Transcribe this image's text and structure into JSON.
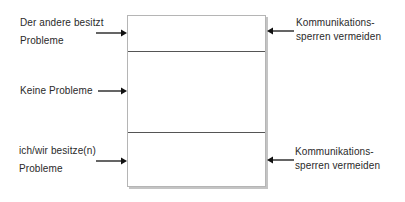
{
  "diagram": {
    "left_labels": [
      {
        "line1": "Der andere besitzt",
        "line2": "Probleme"
      },
      {
        "line1": "Keine Probleme",
        "line2": ""
      },
      {
        "line1": "ich/wir besitze(n)",
        "line2": "Probleme"
      }
    ],
    "right_labels": [
      {
        "line1": "Kommunikations-",
        "line2": "sperren vermeiden"
      },
      {
        "line1": "Kommunikations-",
        "line2": "sperren vermeiden"
      }
    ],
    "box": {
      "sections": [
        "top",
        "middle",
        "bottom"
      ]
    },
    "colors": {
      "text": "#2a2a2a",
      "arrow": "#111111",
      "box_border": "#b5b5b5",
      "divider": "#555555"
    }
  }
}
